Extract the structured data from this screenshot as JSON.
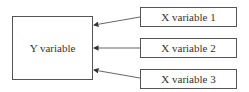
{
  "diagram": {
    "target": {
      "label": "Y variable"
    },
    "sources": [
      {
        "label": "X variable 1"
      },
      {
        "label": "X variable 2"
      },
      {
        "label": "X variable 3"
      }
    ],
    "edges": [
      {
        "from": "X variable 1",
        "to": "Y variable"
      },
      {
        "from": "X variable 2",
        "to": "Y variable"
      },
      {
        "from": "X variable 3",
        "to": "Y variable"
      }
    ],
    "colors": {
      "stroke": "#555555",
      "text": "#333333",
      "background": "#ffffff"
    }
  }
}
